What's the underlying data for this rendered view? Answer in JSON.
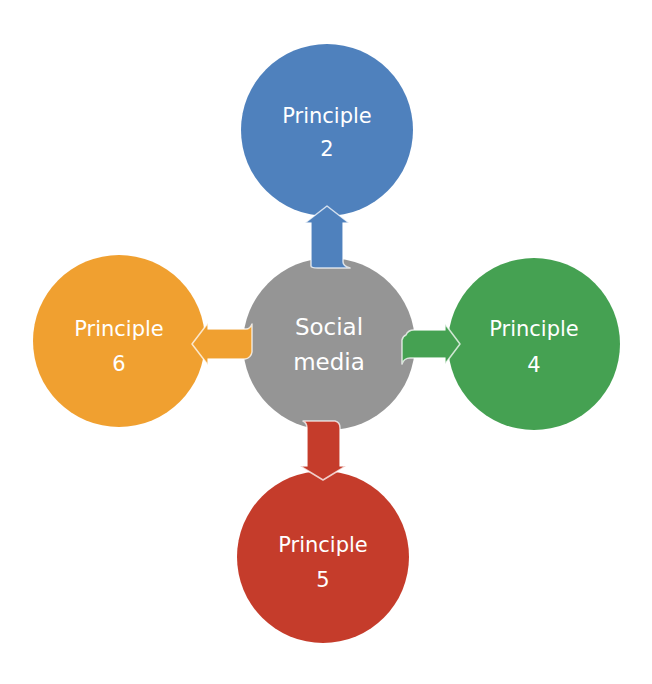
{
  "diagram": {
    "type": "hub-and-spoke",
    "center": {
      "line1": "Social",
      "line2": "media",
      "color": "#959595"
    },
    "nodes": {
      "top": {
        "line1": "Principle",
        "line2": "2",
        "color": "#4f81bd",
        "position": "top"
      },
      "right": {
        "line1": "Principle",
        "line2": "4",
        "color": "#45a152",
        "position": "right"
      },
      "bottom": {
        "line1": "Principle",
        "line2": "5",
        "color": "#c53c2b",
        "position": "bottom"
      },
      "left": {
        "line1": "Principle",
        "line2": "6",
        "color": "#f0a030",
        "position": "left"
      }
    },
    "arrows": [
      {
        "from": "Social media",
        "to": "Principle 2",
        "direction": "up"
      },
      {
        "from": "Social media",
        "to": "Principle 4",
        "direction": "right"
      },
      {
        "from": "Social media",
        "to": "Principle 5",
        "direction": "down"
      },
      {
        "from": "Social media",
        "to": "Principle 6",
        "direction": "left"
      }
    ]
  }
}
